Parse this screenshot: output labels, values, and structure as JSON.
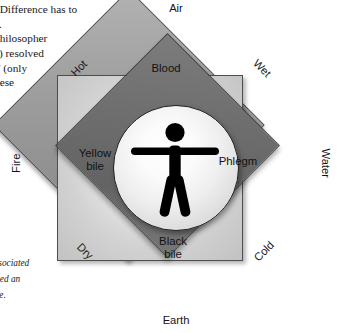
{
  "figure": {
    "type": "four-humours-diagram",
    "center": {
      "icon": "human-figure-icon",
      "description": "human pictogram inside a sphere"
    },
    "humours": [
      {
        "id": "blood",
        "label": "Blood",
        "position": "top"
      },
      {
        "id": "yellow-bile",
        "label": "Yellow\nbile",
        "position": "left"
      },
      {
        "id": "phlegm",
        "label": "Phlegm",
        "position": "right"
      },
      {
        "id": "black-bile",
        "label": "Black\nbile",
        "position": "bottom"
      }
    ],
    "elements": [
      {
        "id": "air",
        "label": "Air",
        "position": "top"
      },
      {
        "id": "water",
        "label": "Water",
        "position": "right"
      },
      {
        "id": "earth",
        "label": "Earth",
        "position": "bottom"
      },
      {
        "id": "fire",
        "label": "Fire",
        "position": "left"
      }
    ],
    "qualities": [
      {
        "id": "hot",
        "label": "Hot",
        "position": "top-left"
      },
      {
        "id": "wet",
        "label": "Wet",
        "position": "top-right"
      },
      {
        "id": "dry",
        "label": "Dry",
        "position": "bottom-left"
      },
      {
        "id": "cold",
        "label": "Cold",
        "position": "bottom-right"
      }
    ],
    "colors": {
      "outer_diamond": "#9d9d9d",
      "inner_diamond": "#6e6e6e",
      "light_square": "#e0e0e0",
      "center_circle": "#f7f7f7",
      "figure": "#000000",
      "outline": "#3d3d3d",
      "text": "#111111",
      "background": "#ffffff"
    }
  },
  "page_text": {
    "top_block": ". Difference has to\ny.\nphilosopher\nc) resolved\ns' (only\nhese",
    "bottom_block": "th,\n\nassociated\nfined an\nage."
  }
}
